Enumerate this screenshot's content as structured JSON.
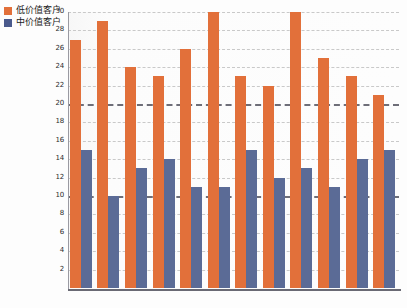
{
  "chart_data": {
    "type": "bar",
    "title": "",
    "subtitle": "",
    "xlabel": "",
    "ylabel": "",
    "ylim": [
      0,
      30
    ],
    "ytick_step": 2,
    "yticks": [
      30,
      28,
      26,
      24,
      22,
      20,
      18,
      16,
      14,
      12,
      10,
      8,
      6,
      4,
      2
    ],
    "grid": true,
    "grid_style": "dashed",
    "emphasized_gridlines": [
      20,
      10
    ],
    "legend_position": "top-left",
    "categories": [
      "1",
      "2",
      "3",
      "4",
      "5",
      "6",
      "7",
      "8",
      "9",
      "10",
      "11",
      "12"
    ],
    "series": [
      {
        "name": "低价值客户",
        "color": "#e2703a",
        "values": [
          27,
          29,
          24,
          23,
          26,
          30,
          23,
          22,
          30,
          25,
          23,
          21
        ]
      },
      {
        "name": "中价值客户",
        "color": "#5b6b96",
        "values": [
          15,
          10,
          13,
          14,
          11,
          11,
          15,
          12,
          13,
          11,
          14,
          15
        ]
      }
    ]
  },
  "legend": {
    "items": [
      {
        "label": "低价值客户",
        "color": "#e2703a"
      },
      {
        "label": "中价值客户",
        "color": "#4a5a8c"
      }
    ]
  },
  "colors": {
    "low_value": "#e2703a",
    "mid_value": "#5b6b96",
    "grid": "#c9c9c9",
    "grid_major": "#6e6e78",
    "axis": "#6a6a74",
    "background": "#fdfdfd"
  }
}
